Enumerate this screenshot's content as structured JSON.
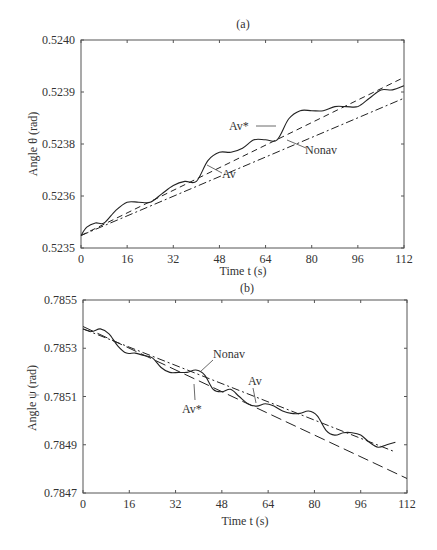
{
  "chart_data": [
    {
      "type": "line",
      "title": "(a)",
      "xlabel": "Time t (s)",
      "ylabel": "Angle θ (rad)",
      "xlim": [
        0,
        112
      ],
      "x_ticks": [
        "0",
        "16",
        "32",
        "48",
        "64",
        "80",
        "96",
        "112"
      ],
      "y_ticks": [
        "0.5235",
        "0.5236",
        "0.5238",
        "0.5239",
        "0.5240"
      ],
      "grid": false,
      "legend": "inline annotations",
      "annotations": [
        "Av*",
        "Nonav",
        "Av"
      ],
      "series": [
        {
          "name": "Av*",
          "style": "dashed",
          "x": [
            0,
            112
          ],
          "y": [
            0.52353,
            0.52391
          ]
        },
        {
          "name": "Av",
          "style": "dash-dot",
          "x": [
            0,
            112
          ],
          "y": [
            0.52353,
            0.52386
          ]
        },
        {
          "name": "Nonav",
          "style": "solid",
          "x": [
            0,
            2,
            5,
            8,
            12,
            16,
            20,
            24,
            28,
            32,
            36,
            40,
            44,
            48,
            52,
            56,
            60,
            64,
            68,
            72,
            76,
            80,
            84,
            88,
            92,
            96,
            100,
            104,
            108,
            112
          ],
          "y": [
            0.52353,
            0.52355,
            0.52356,
            0.52356,
            0.52359,
            0.52361,
            0.52361,
            0.52361,
            0.52363,
            0.52365,
            0.52366,
            0.52366,
            0.52371,
            0.52373,
            0.52373,
            0.52374,
            0.52376,
            0.52376,
            0.52376,
            0.52381,
            0.52383,
            0.52383,
            0.52383,
            0.52384,
            0.52384,
            0.52384,
            0.52386,
            0.52388,
            0.52388,
            0.52389
          ]
        }
      ]
    },
    {
      "type": "line",
      "title": "(b)",
      "xlabel": "Time t (s)",
      "ylabel": "Angle ψ (rad)",
      "xlim": [
        0,
        112
      ],
      "x_ticks": [
        "0",
        "16",
        "32",
        "48",
        "64",
        "80",
        "96",
        "112"
      ],
      "y_ticks": [
        "0.7847",
        "0.7849",
        "0.7851",
        "0.7853",
        "0.7855"
      ],
      "ylim": [
        0.7847,
        0.7855
      ],
      "grid": false,
      "legend": "inline annotations",
      "annotations": [
        "Nonav",
        "Av",
        "Av*"
      ],
      "series": [
        {
          "name": "Av*",
          "style": "long-dashed",
          "x": [
            0,
            112
          ],
          "y": [
            0.78539,
            0.78476
          ]
        },
        {
          "name": "Av",
          "style": "dash-dot",
          "x": [
            0,
            108
          ],
          "y": [
            0.78538,
            0.78487
          ]
        },
        {
          "name": "Nonav",
          "style": "solid",
          "x": [
            0,
            3,
            6,
            9,
            12,
            15,
            18,
            21,
            24,
            27,
            30,
            33,
            36,
            39,
            42,
            45,
            48,
            51,
            54,
            57,
            60,
            63,
            66,
            69,
            72,
            75,
            78,
            81,
            84,
            87,
            90,
            93,
            96,
            99,
            102,
            105,
            108
          ],
          "y": [
            0.78538,
            0.78537,
            0.78538,
            0.78536,
            0.78531,
            0.78528,
            0.78528,
            0.78527,
            0.78526,
            0.78522,
            0.7852,
            0.7852,
            0.7852,
            0.78521,
            0.78519,
            0.78513,
            0.78512,
            0.78513,
            0.7851,
            0.78507,
            0.78506,
            0.78507,
            0.78506,
            0.78504,
            0.78503,
            0.78503,
            0.78504,
            0.78502,
            0.78496,
            0.78494,
            0.78495,
            0.78495,
            0.78494,
            0.78491,
            0.78489,
            0.7849,
            0.78491
          ]
        }
      ]
    }
  ],
  "panels": {
    "a": {
      "title": "(a)",
      "xlabel": "Time t (s)",
      "ylabel": "Angle θ (rad)",
      "labels": {
        "avstar": "Av*",
        "nonav": "Nonav",
        "av": "Av"
      }
    },
    "b": {
      "title": "(b)",
      "xlabel": "Time t (s)",
      "ylabel": "Angle ψ (rad)",
      "labels": {
        "avstar": "Av*",
        "nonav": "Nonav",
        "av": "Av"
      }
    }
  }
}
